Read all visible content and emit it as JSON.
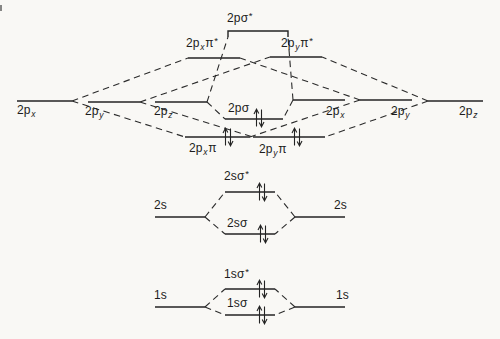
{
  "diagram": {
    "kind": "molecular-orbital-energy-level-diagram",
    "ink_color": "#232323",
    "paper_color": "#f9f8f5",
    "labels": {
      "p2x_left": {
        "base": "2p",
        "sub": "x"
      },
      "p2y_left": {
        "base": "2p",
        "sub": "y"
      },
      "p2z_left": {
        "base": "2p",
        "sub": "z"
      },
      "p2x_right": {
        "base": "2p",
        "sub": "x"
      },
      "p2y_right": {
        "base": "2p",
        "sub": "y"
      },
      "p2z_right": {
        "base": "2p",
        "sub": "z"
      },
      "p_sigma_star": {
        "base": "2pσ",
        "sup": "*"
      },
      "p_pi_x_star": {
        "base": "2p",
        "sub": "x",
        "tail": "π",
        "sup": "*"
      },
      "p_pi_y_star": {
        "base": "2p",
        "sub": "y",
        "tail": "π",
        "sup": "*"
      },
      "p_sigma": {
        "base": "2pσ"
      },
      "p_pi_x": {
        "base": "2p",
        "sub": "x",
        "tail": "π"
      },
      "p_pi_y": {
        "base": "2p",
        "sub": "y",
        "tail": "π"
      },
      "s2_left": {
        "base": "2s"
      },
      "s2_right": {
        "base": "2s"
      },
      "s2_sigma_star": {
        "base": "2sσ",
        "sup": "*"
      },
      "s2_sigma": {
        "base": "2sσ"
      },
      "s1_left": {
        "base": "1s"
      },
      "s1_right": {
        "base": "1s"
      },
      "s1_sigma_star": {
        "base": "1sσ",
        "sup": "*"
      },
      "s1_sigma": {
        "base": "1sσ"
      }
    },
    "molecular_levels": [
      {
        "name": "2pσ*",
        "electrons": 0
      },
      {
        "name": "2pxπ*",
        "electrons": 0
      },
      {
        "name": "2pyπ*",
        "electrons": 0
      },
      {
        "name": "2pσ",
        "electrons": 2
      },
      {
        "name": "2pxπ",
        "electrons": 2
      },
      {
        "name": "2pyπ",
        "electrons": 2
      },
      {
        "name": "2sσ*",
        "electrons": 2
      },
      {
        "name": "2sσ",
        "electrons": 2
      },
      {
        "name": "1sσ*",
        "electrons": 2
      },
      {
        "name": "1sσ",
        "electrons": 2
      }
    ],
    "atomic_levels_left": [
      "2px",
      "2py",
      "2pz",
      "2s",
      "1s"
    ],
    "atomic_levels_right": [
      "2px",
      "2py",
      "2pz",
      "2s",
      "1s"
    ]
  }
}
